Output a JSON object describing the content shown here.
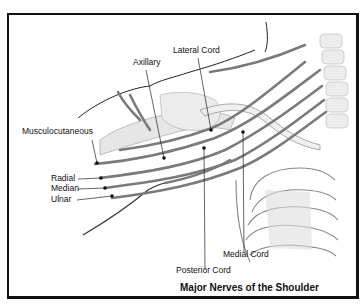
{
  "figure": {
    "title": "Major Nerves of the Shoulder",
    "labels": {
      "lateral_cord": "Lateral Cord",
      "axillary": "Axillary",
      "musculocutaneous": "Musculocutaneous",
      "radial": "Radial",
      "median": "Median",
      "ulnar": "Ulnar",
      "medial_cord": "Medial Cord",
      "posterior_cord": "Posterior Cord"
    },
    "colors": {
      "frame": "#111111",
      "nerve": "#7a7a7a",
      "bone_shade": "#d8d8d8",
      "line": "#222222"
    }
  }
}
